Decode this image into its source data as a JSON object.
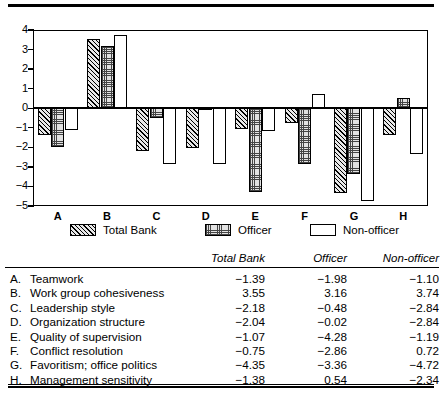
{
  "chart_data": {
    "type": "bar",
    "title": "",
    "xlabel": "",
    "ylabel": "",
    "ylim": [
      -5,
      4
    ],
    "yticks": [
      4,
      3,
      2,
      1,
      0,
      -1,
      -2,
      -3,
      -4,
      -5
    ],
    "ytick_labels": [
      "4",
      "3",
      "2",
      "1",
      "0",
      "−1",
      "−2",
      "−3",
      "−4",
      "−5"
    ],
    "categories": [
      "A",
      "B",
      "C",
      "D",
      "E",
      "F",
      "G",
      "H"
    ],
    "grid": false,
    "legend_position": "below-axes",
    "series": [
      {
        "name": "Total Bank",
        "fill": "hatch",
        "values": [
          -1.39,
          3.55,
          -2.18,
          -2.04,
          -1.07,
          -0.75,
          -4.35,
          -1.38
        ]
      },
      {
        "name": "Officer",
        "fill": "dot",
        "values": [
          -1.98,
          3.16,
          -0.48,
          -0.02,
          -4.28,
          -2.86,
          -3.36,
          0.54
        ]
      },
      {
        "name": "Non-officer",
        "fill": "none",
        "values": [
          -1.1,
          3.74,
          -2.84,
          -2.84,
          -1.19,
          0.72,
          -4.72,
          -2.34
        ]
      }
    ]
  },
  "legend": {
    "items": [
      {
        "label": "Total Bank",
        "swatch": "hatch-swatch-icon"
      },
      {
        "label": "Officer",
        "swatch": "dot-swatch-icon"
      },
      {
        "label": "Non-officer",
        "swatch": "empty-swatch-icon"
      }
    ]
  },
  "table": {
    "headers": {
      "item": "",
      "total_bank": "Total Bank",
      "officer": "Officer",
      "non_officer": "Non-officer"
    },
    "rows": [
      {
        "key": "A.",
        "name": "Teamwork",
        "total_bank": "−1.39",
        "officer": "−1.98",
        "non_officer": "−1.10"
      },
      {
        "key": "B.",
        "name": "Work group cohesiveness",
        "total_bank": "3.55",
        "officer": "3.16",
        "non_officer": "3.74"
      },
      {
        "key": "C.",
        "name": "Leadership style",
        "total_bank": "−2.18",
        "officer": "−0.48",
        "non_officer": "−2.84"
      },
      {
        "key": "D.",
        "name": "Organization structure",
        "total_bank": "−2.04",
        "officer": "−0.02",
        "non_officer": "−2.84"
      },
      {
        "key": "E.",
        "name": "Quality of supervision",
        "total_bank": "−1.07",
        "officer": "−4.28",
        "non_officer": "−1.19"
      },
      {
        "key": "F.",
        "name": "Conflict resolution",
        "total_bank": "−0.75",
        "officer": "−2.86",
        "non_officer": "0.72"
      },
      {
        "key": "G.",
        "name": "Favoritism; office politics",
        "total_bank": "−4.35",
        "officer": "−3.36",
        "non_officer": "−4.72"
      },
      {
        "key": "H.",
        "name": "Management sensitivity",
        "total_bank": "−1.38",
        "officer": "0.54",
        "non_officer": "−2.34"
      }
    ]
  },
  "colors": {
    "ink": "#000000",
    "paper": "#ffffff",
    "hatch_fill": "#e8e8e8",
    "dot_fill": "#e2e2e2"
  }
}
